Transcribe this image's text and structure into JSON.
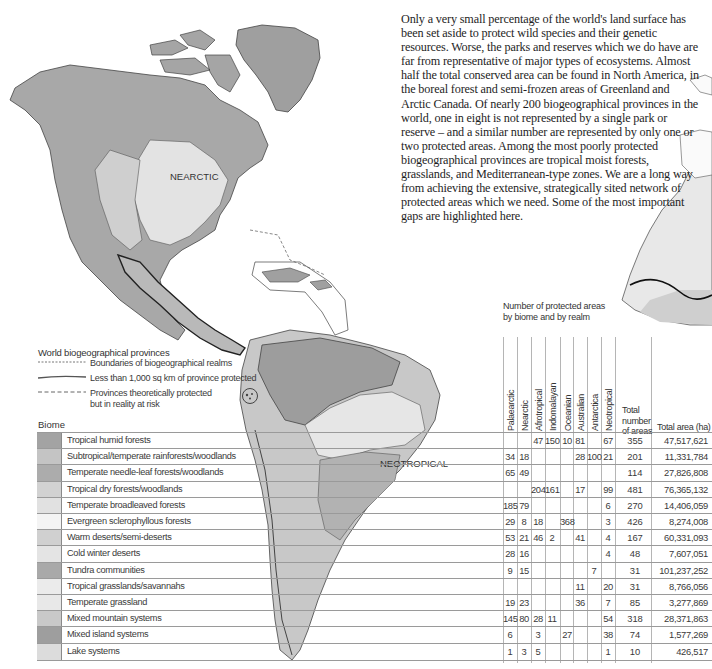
{
  "intro_text": "Only a very small percentage of the world's land surface has been set aside to protect wild species and their genetic resources. Worse, the parks and reserves which we do have are far from representative of major types of ecosystems. Almost half the total conserved area can be found in North America, in the boreal forest and semi-frozen areas of Greenland and Arctic Canada. Of nearly 200 biogeographical provinces in the world, one in eight is not represented by a single park or reserve – and a similar number are represented by only one or two protected areas. Among the most poorly protected biogeographical provinces are tropical moist forests, grasslands, and Mediterranean-type zones. We are a long way from achieving the extensive, strategically sited network of protected areas which we need. Some of the most important gaps are highlighted here.",
  "map": {
    "realm_labels": [
      "NEARCTIC",
      "NEOTROPICAL"
    ]
  },
  "legend": {
    "title": "World biogeographical provinces",
    "items": [
      {
        "label": "Boundaries of biogeographical realms",
        "style": "dotted"
      },
      {
        "label": "Less than 1,000 sq km of province protected",
        "style": "solid-thick"
      },
      {
        "label": "Provinces theoretically protected but in reality at risk",
        "style": "dashed"
      }
    ]
  },
  "table": {
    "biome_header": "Biome",
    "title_line1": "Number of protected areas",
    "title_line2": "by biome and by realm",
    "realms": [
      "Palaearctic",
      "Nearctic",
      "Afrotropical",
      "Indomalayan",
      "Oceanian",
      "Australian",
      "Antarctica",
      "Neotropical"
    ],
    "total_header_lines": [
      "Total",
      "number",
      "of areas"
    ],
    "area_header": "Total area (ha)",
    "rows": [
      {
        "biome": "Tropical humid forests",
        "swatch": "#a3a3a3",
        "counts": [
          "",
          "",
          "47",
          "150",
          "10",
          "81",
          "",
          "67"
        ],
        "total": "355",
        "area": "47,517,621"
      },
      {
        "biome": "Subtropical/temperate rainforests/woodlands",
        "swatch": "#c4c4c4",
        "counts": [
          "34",
          "18",
          "",
          "",
          "",
          "28",
          "100",
          "21"
        ],
        "total": "201",
        "area": "11,331,784"
      },
      {
        "biome": "Temperate needle-leaf forests/woodlands",
        "swatch": "#acacac",
        "counts": [
          "65",
          "49",
          "",
          "",
          "",
          "",
          "",
          ""
        ],
        "total": "114",
        "area": "27,826,808"
      },
      {
        "biome": "Tropical dry forests/woodlands",
        "swatch": "#d2d2d2",
        "counts": [
          "",
          "",
          "204",
          "161",
          "",
          "17",
          "",
          "99"
        ],
        "total": "481",
        "area": "76,365,132"
      },
      {
        "biome": "Temperate broadleaved forests",
        "swatch": "#e1e1e1",
        "counts": [
          "185",
          "79",
          "",
          "",
          "",
          "",
          "",
          "6"
        ],
        "total": "270",
        "area": "14,406,059"
      },
      {
        "biome": "Evergreen sclerophyllous forests",
        "swatch": "#f4f4f4",
        "counts": [
          "29",
          "8",
          "18",
          "",
          "368",
          "",
          "",
          "3"
        ],
        "total": "426",
        "area": "8,274,008"
      },
      {
        "biome": "Warm deserts/semi-deserts",
        "swatch": "#d0d0d0",
        "counts": [
          "53",
          "21",
          "46",
          "2",
          "",
          "41",
          "",
          "4"
        ],
        "total": "167",
        "area": "60,331,093"
      },
      {
        "biome": "Cold winter deserts",
        "swatch": "#e4e4e4",
        "counts": [
          "28",
          "16",
          "",
          "",
          "",
          "",
          "",
          "4"
        ],
        "total": "48",
        "area": "7,607,051"
      },
      {
        "biome": "Tundra communities",
        "swatch": "#a9a9a9",
        "counts": [
          "9",
          "15",
          "",
          "",
          "",
          "",
          "7",
          ""
        ],
        "total": "31",
        "area": "101,237,252"
      },
      {
        "biome": "Tropical grasslands/savannahs",
        "swatch": "#ebebeb",
        "counts": [
          "",
          "",
          "",
          "",
          "",
          "11",
          "",
          "20"
        ],
        "total": "31",
        "area": "8,766,056"
      },
      {
        "biome": "Temperate grassland",
        "swatch": "#e8e8e8",
        "counts": [
          "19",
          "23",
          "",
          "",
          "",
          "36",
          "",
          "7"
        ],
        "total": "85",
        "area": "3,277,869"
      },
      {
        "biome": "Mixed mountain systems",
        "swatch": "#c9c9c9",
        "counts": [
          "145",
          "80",
          "28",
          "11",
          "",
          "",
          "",
          "54"
        ],
        "total": "318",
        "area": "28,371,863"
      },
      {
        "biome": "Mixed island systems",
        "swatch": "#9e9e9e",
        "counts": [
          "6",
          "",
          "3",
          "",
          "27",
          "",
          "",
          "38"
        ],
        "total": "74",
        "area": "1,577,269"
      },
      {
        "biome": "Lake systems",
        "swatch": "#dcdcdc",
        "counts": [
          "1",
          "3",
          "5",
          "",
          "",
          "",
          "",
          "1"
        ],
        "total": "10",
        "area": "426,517"
      }
    ]
  }
}
